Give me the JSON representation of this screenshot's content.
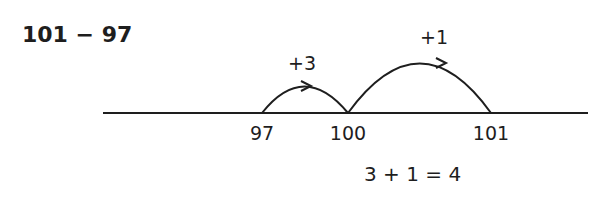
{
  "problem": "101 − 97",
  "number_line": {
    "ticks": [
      {
        "value": 97,
        "label": "97"
      },
      {
        "value": 100,
        "label": "100"
      },
      {
        "value": 101,
        "label": "101"
      }
    ],
    "jumps": [
      {
        "from": 97,
        "to": 100,
        "label": "+3"
      },
      {
        "from": 100,
        "to": 101,
        "label": "+1"
      }
    ]
  },
  "result": "3 + 1 = 4"
}
